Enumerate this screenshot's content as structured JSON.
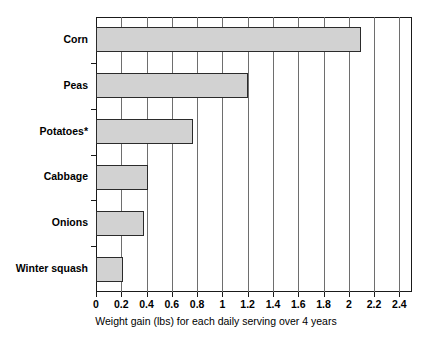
{
  "chart_data": {
    "type": "bar",
    "orientation": "horizontal",
    "title": "",
    "subtitle": "",
    "categories": [
      "Corn",
      "Peas",
      "Potatoes*",
      "Cabbage",
      "Onions",
      "Winter squash"
    ],
    "values": [
      2.1,
      1.2,
      0.77,
      0.41,
      0.38,
      0.21
    ],
    "series": [
      {
        "name": "Weight gain (lbs)",
        "values": [
          2.1,
          1.2,
          0.77,
          0.41,
          0.38,
          0.21
        ]
      }
    ],
    "xlabel": "Weight gain (lbs) for each daily serving over 4 years",
    "ylabel": "",
    "xlim": [
      0,
      2.5
    ],
    "ylim": null,
    "xticks": [
      0,
      0.2,
      0.4,
      0.6,
      0.8,
      1,
      1.2,
      1.4,
      1.6,
      1.8,
      2,
      2.2,
      2.4
    ],
    "xticklabels": [
      "0",
      "0.2",
      "0.4",
      "0.6",
      "0.8",
      "1",
      "1.2",
      "1.4",
      "1.6",
      "1.8",
      "2",
      "2.2",
      "2.4"
    ],
    "grid": "vertical",
    "legend": null,
    "annotations": [
      "*"
    ],
    "colors": {
      "bar_fill": "#d2d2d2",
      "bar_stroke": "#2b2b2b",
      "gridline": "#6e6e6e",
      "frame": "#1a1a1a",
      "text": "#000000",
      "background": "#ffffff"
    }
  }
}
